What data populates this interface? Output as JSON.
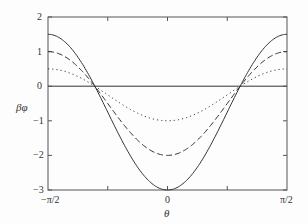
{
  "chart_data": {
    "type": "line",
    "title": "",
    "xlabel": "θ",
    "ylabel": "βφ",
    "xlim": [
      -1.5708,
      1.5708
    ],
    "ylim": [
      -3,
      2
    ],
    "x_ticks": [
      "−π/2",
      "0",
      "π/2"
    ],
    "y_ticks": [
      "2",
      "1",
      "0",
      "−1",
      "−2",
      "−3"
    ],
    "grid": false,
    "legend": null,
    "horizontal_reference_line": 0,
    "series": [
      {
        "name": "solid",
        "style": "solid",
        "formula": "-0.75 - 2.25*cos(2θ)",
        "x": [
          -1.5708,
          -1.1781,
          -0.9553,
          -0.7854,
          -0.3927,
          0,
          0.3927,
          0.7854,
          0.9553,
          1.1781,
          1.5708
        ],
        "values": [
          1.5,
          0.84,
          0.0,
          -0.75,
          -2.34,
          -3.0,
          -2.34,
          -0.75,
          0.0,
          0.84,
          1.5
        ]
      },
      {
        "name": "dashed",
        "style": "dashed",
        "formula": "-0.5 - 1.5*cos(2θ)",
        "x": [
          -1.5708,
          -1.1781,
          -0.9553,
          -0.7854,
          -0.3927,
          0,
          0.3927,
          0.7854,
          0.9553,
          1.1781,
          1.5708
        ],
        "values": [
          1.0,
          0.56,
          0.0,
          -0.5,
          -1.56,
          -2.0,
          -1.56,
          -0.5,
          0.0,
          0.56,
          1.0
        ]
      },
      {
        "name": "dotted",
        "style": "dotted",
        "formula": "-0.25 - 0.75*cos(2θ)",
        "x": [
          -1.5708,
          -1.1781,
          -0.9553,
          -0.7854,
          -0.3927,
          0,
          0.3927,
          0.7854,
          0.9553,
          1.1781,
          1.5708
        ],
        "values": [
          0.5,
          0.28,
          0.0,
          -0.25,
          -0.78,
          -1.0,
          -0.78,
          -0.25,
          0.0,
          0.28,
          0.5
        ]
      }
    ]
  },
  "labels": {
    "xlabel": "θ",
    "ylabel": "βφ",
    "y2": "2",
    "y1": "1",
    "y0": "0",
    "ym1": "−1",
    "ym2": "−2",
    "ym3": "−3",
    "xleft": "−π/2",
    "xmid": "0",
    "xright": "π/2"
  },
  "colors": {
    "line": "#333333",
    "axis": "#555555"
  }
}
